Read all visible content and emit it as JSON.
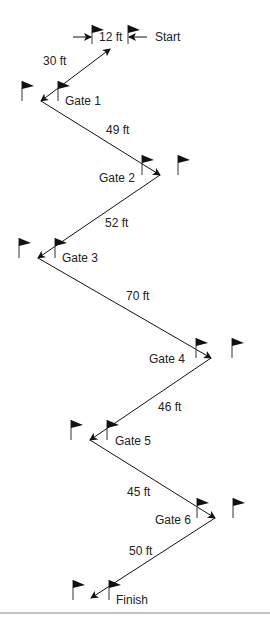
{
  "diagram": {
    "start_label": "Start",
    "start_gap_label": "12 ft",
    "finish_label": "Finish",
    "gates": [
      {
        "label": "Gate 1",
        "x": 41,
        "y": 101,
        "lx": 65,
        "ly": 105,
        "flags": [
          22,
          58
        ]
      },
      {
        "label": "Gate 2",
        "x": 160,
        "y": 175,
        "lx": 99,
        "ly": 182,
        "flags": [
          142,
          178
        ]
      },
      {
        "label": "Gate 3",
        "x": 38,
        "y": 258,
        "lx": 62,
        "ly": 262,
        "flags": [
          19,
          55
        ]
      },
      {
        "label": "Gate 4",
        "x": 211,
        "y": 358,
        "lx": 149,
        "ly": 363,
        "flags": [
          196,
          232
        ]
      },
      {
        "label": "Gate 5",
        "x": 90,
        "y": 440,
        "lx": 115,
        "ly": 445,
        "flags": [
          71,
          107
        ]
      },
      {
        "label": "Gate 6",
        "x": 215,
        "y": 518,
        "lx": 155,
        "ly": 524,
        "flags": [
          197,
          233
        ]
      }
    ],
    "segments": [
      {
        "from": [
          110,
          49
        ],
        "to": [
          41,
          101
        ],
        "label": "30 ft",
        "lx": 43,
        "ly": 65,
        "both": true
      },
      {
        "from": [
          41,
          101
        ],
        "to": [
          160,
          175
        ],
        "label": "49 ft",
        "lx": 106,
        "ly": 134
      },
      {
        "from": [
          160,
          175
        ],
        "to": [
          38,
          258
        ],
        "label": "52 ft",
        "lx": 105,
        "ly": 227
      },
      {
        "from": [
          38,
          258
        ],
        "to": [
          211,
          358
        ],
        "label": "70 ft",
        "lx": 126,
        "ly": 300
      },
      {
        "from": [
          211,
          358
        ],
        "to": [
          90,
          440
        ],
        "label": "46 ft",
        "lx": 158,
        "ly": 411
      },
      {
        "from": [
          90,
          440
        ],
        "to": [
          215,
          518
        ],
        "label": "45 ft",
        "lx": 127,
        "ly": 496
      },
      {
        "from": [
          215,
          518
        ],
        "to": [
          91,
          598
        ],
        "label": "50 ft",
        "lx": 129,
        "ly": 555
      }
    ]
  }
}
